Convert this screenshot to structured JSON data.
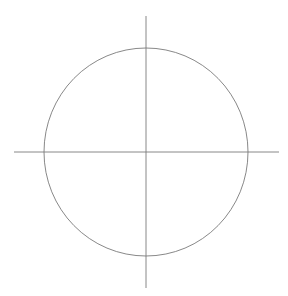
{
  "diagram": {
    "type": "circle-with-crosshair-axes",
    "background": "#ffffff",
    "stroke_color": "#7a7a7a",
    "circle": {
      "cx": 146,
      "cy": 152,
      "rx": 102,
      "ry": 104
    },
    "horizontal_axis": {
      "x1": 14,
      "y1": 152,
      "x2": 279,
      "y2": 152
    },
    "vertical_axis": {
      "x1": 146,
      "y1": 16,
      "x2": 146,
      "y2": 288
    }
  }
}
